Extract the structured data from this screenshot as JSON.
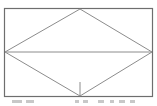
{
  "figure": {
    "type": "geometry-diagram",
    "stroke_color": "#8c8c8c",
    "frame_color": "#6e6e6e",
    "background": "#ffffff",
    "frame": {
      "x": 4,
      "y": 8,
      "width": 149,
      "height": 89
    },
    "rhombus": {
      "top": [
        80,
        9
      ],
      "left": [
        5,
        52
      ],
      "right": [
        152,
        52
      ],
      "bottom": [
        80,
        96
      ]
    },
    "horizontal_diagonal": {
      "y": 52,
      "x1": 5,
      "x2": 152
    },
    "tick_segment": {
      "x": 80,
      "y1": 82,
      "y2": 96
    }
  },
  "caption": {
    "visible": "partially cut off (illegible)"
  }
}
